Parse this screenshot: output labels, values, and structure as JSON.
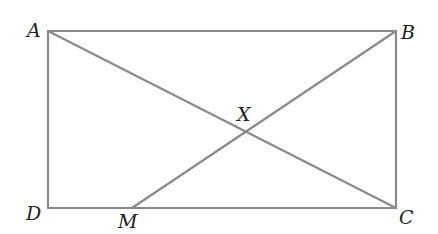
{
  "diagram": {
    "type": "geometry",
    "points": {
      "A": {
        "label": "A",
        "x": 48,
        "y": 31
      },
      "B": {
        "label": "B",
        "x": 396,
        "y": 31
      },
      "C": {
        "label": "C",
        "x": 396,
        "y": 208
      },
      "D": {
        "label": "D",
        "x": 48,
        "y": 208
      },
      "M": {
        "label": "M",
        "x": 132,
        "y": 208
      },
      "X": {
        "label": "X",
        "x": 244,
        "y": 132
      }
    },
    "segments": [
      "AB",
      "BC",
      "CD",
      "DA",
      "AC",
      "BM"
    ],
    "line_color": "#8a8a8a"
  }
}
